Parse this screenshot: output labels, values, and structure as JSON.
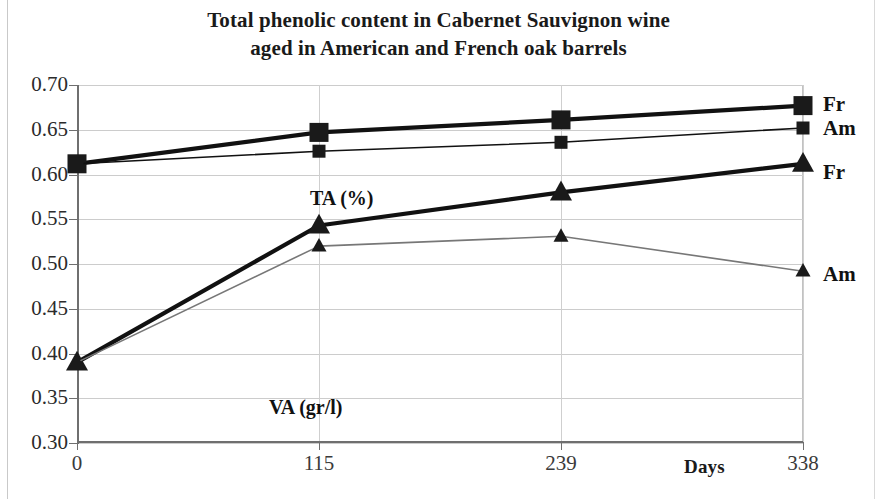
{
  "chart_data": {
    "type": "line",
    "title": "Total phenolic content in Cabernet Sauvignon wine aged in American and French oak barrels",
    "title_line1": "Total phenolic content in Cabernet Sauvignon wine",
    "title_line2": "aged in American and French oak barrels",
    "xlabel": "Days",
    "ylabel": "",
    "categories": [
      "0",
      "115",
      "239",
      "338"
    ],
    "x": [
      0,
      115,
      239,
      338
    ],
    "ylim": [
      0.3,
      0.7
    ],
    "ytick_labels": [
      "0.70",
      "0.65",
      "0.60",
      "0.55",
      "0.50",
      "0.45",
      "0.40",
      "0.35",
      "0.30"
    ],
    "yticks": [
      0.7,
      0.65,
      0.6,
      0.55,
      0.5,
      0.45,
      0.4,
      0.35,
      0.3
    ],
    "grid": true,
    "legend_position": "right-of-plot (series end labels)",
    "annotations": [
      {
        "text": "TA (%)",
        "near_series": "TA French / TA American"
      },
      {
        "text": "VA (gr/l)",
        "near_series": "VA French / VA American"
      }
    ],
    "series": [
      {
        "name": "Fr",
        "group": "TA (%)",
        "marker": "square",
        "line_style": "solid-heavy",
        "color": "#111111",
        "end_label": "Fr",
        "values": [
          0.612,
          0.647,
          0.661,
          0.677
        ]
      },
      {
        "name": "Am",
        "group": "TA (%)",
        "marker": "square",
        "line_style": "solid-thin",
        "color": "#111111",
        "end_label": "Am",
        "values": [
          0.612,
          0.626,
          0.636,
          0.652
        ]
      },
      {
        "name": "Fr",
        "group": "VA (gr/l)",
        "marker": "triangle",
        "line_style": "solid-heavy",
        "color": "#111111",
        "end_label": "Fr",
        "values": [
          0.39,
          0.543,
          0.58,
          0.612
        ]
      },
      {
        "name": "Am",
        "group": "VA (gr/l)",
        "marker": "triangle",
        "line_style": "solid-thin",
        "color": "#777777",
        "end_label": "Am",
        "values": [
          0.39,
          0.52,
          0.531,
          0.492
        ]
      }
    ]
  },
  "axis": {
    "x_title": "Days"
  },
  "labels": {
    "ta_annotation": "TA (%)",
    "va_annotation": "VA (gr/l)",
    "ta_fr": "Fr",
    "ta_am": "Am",
    "va_fr": "Fr",
    "va_am": "Am"
  }
}
